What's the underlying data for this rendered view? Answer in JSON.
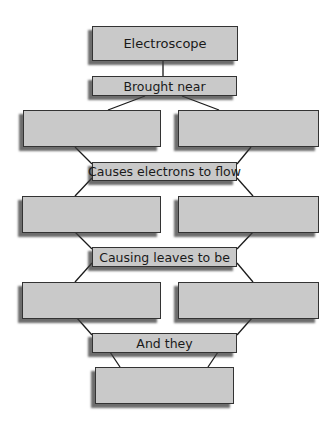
{
  "diagram": {
    "title_box": "Electroscope",
    "connectors": [
      "Brought near",
      "Causes electrons to flow",
      "Causing leaves to be",
      "And they"
    ],
    "blank_boxes": [
      {
        "row": 1,
        "side": "left",
        "text": ""
      },
      {
        "row": 1,
        "side": "right",
        "text": ""
      },
      {
        "row": 2,
        "side": "left",
        "text": ""
      },
      {
        "row": 2,
        "side": "right",
        "text": ""
      },
      {
        "row": 3,
        "side": "left",
        "text": ""
      },
      {
        "row": 3,
        "side": "right",
        "text": ""
      },
      {
        "row": 4,
        "side": "center",
        "text": ""
      }
    ],
    "colors": {
      "box_fill": "#c9c9c9",
      "border": "#333333",
      "line": "#1a1a1a"
    }
  }
}
